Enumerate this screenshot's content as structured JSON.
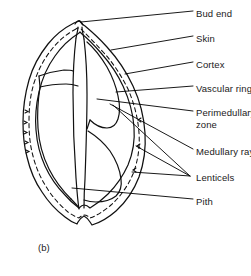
{
  "figure": {
    "caption": "(b)",
    "colors": {
      "ink": "#1a1a1a",
      "background": "#ffffff",
      "leader_line": "#000000"
    }
  },
  "labels": [
    {
      "id": "bud-end",
      "text": "Bud end",
      "text2": "",
      "x": 196,
      "y": 14
    },
    {
      "id": "skin",
      "text": "Skin",
      "text2": "",
      "x": 196,
      "y": 39
    },
    {
      "id": "cortex",
      "text": "Cortex",
      "text2": "",
      "x": 196,
      "y": 65
    },
    {
      "id": "vascular-ring",
      "text": "Vascular ring",
      "text2": "",
      "x": 196,
      "y": 89
    },
    {
      "id": "perimedullary-zone",
      "text": "Perimedullary",
      "text2": "zone",
      "x": 196,
      "y": 114
    },
    {
      "id": "medullary-rays",
      "text": "Medullary rays",
      "text2": "",
      "x": 196,
      "y": 152
    },
    {
      "id": "lenticels",
      "text": "Lenticels",
      "text2": "",
      "x": 196,
      "y": 178
    },
    {
      "id": "pith",
      "text": "Pith",
      "text2": "",
      "x": 196,
      "y": 202
    }
  ],
  "caption": {
    "text": "(b)",
    "x": 38,
    "y": 248
  }
}
